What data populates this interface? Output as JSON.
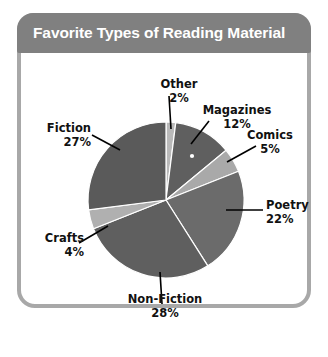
{
  "card": {
    "title": "Favorite Types of Reading Material",
    "frame_color": "#a8a8a8",
    "title_bar_color": "#808080",
    "title_text_color": "#ffffff",
    "background_color": "#ffffff"
  },
  "chart_data": {
    "type": "pie",
    "title": "Favorite Types of Reading Material",
    "xlabel": "",
    "ylabel": "",
    "unit": "%",
    "legend": "none",
    "grid": false,
    "labels_show_name_and_percent": true,
    "start_angle_deg": 0,
    "direction": "clockwise",
    "categories": [
      "Other",
      "Magazines",
      "Comics",
      "Poetry",
      "Non-Fiction",
      "Crafts",
      "Fiction"
    ],
    "values": [
      2,
      12,
      5,
      22,
      28,
      4,
      27
    ],
    "colors": [
      "#b9b9b9",
      "#5f5f5f",
      "#a9a9a9",
      "#6b6b6b",
      "#5f5f5f",
      "#b0b0b0",
      "#5a5a5a"
    ],
    "slices": [
      {
        "name": "Other",
        "value": 2,
        "label": "Other",
        "percent_label": "2%",
        "color": "#b9b9b9"
      },
      {
        "name": "Magazines",
        "value": 12,
        "label": "Magazines",
        "percent_label": "12%",
        "color": "#5f5f5f"
      },
      {
        "name": "Comics",
        "value": 5,
        "label": "Comics",
        "percent_label": "5%",
        "color": "#a9a9a9"
      },
      {
        "name": "Poetry",
        "value": 22,
        "label": "Poetry",
        "percent_label": "22%",
        "color": "#6b6b6b"
      },
      {
        "name": "Non-Fiction",
        "value": 28,
        "label": "Non-Fiction",
        "percent_label": "28%",
        "color": "#5f5f5f"
      },
      {
        "name": "Crafts",
        "value": 4,
        "label": "Crafts",
        "percent_label": "4%",
        "color": "#b0b0b0"
      },
      {
        "name": "Fiction",
        "value": 27,
        "label": "Fiction",
        "percent_label": "27%",
        "color": "#5a5a5a"
      }
    ],
    "total": 100
  },
  "labels": {
    "other": {
      "name": "Other",
      "percent": "2%"
    },
    "magazines": {
      "name": "Magazines",
      "percent": "12%"
    },
    "comics": {
      "name": "Comics",
      "percent": "5%"
    },
    "poetry": {
      "name": "Poetry",
      "percent": "22%"
    },
    "non_fiction": {
      "name": "Non-Fiction",
      "percent": "28%"
    },
    "crafts": {
      "name": "Crafts",
      "percent": "4%"
    },
    "fiction": {
      "name": "Fiction",
      "percent": "27%"
    }
  }
}
